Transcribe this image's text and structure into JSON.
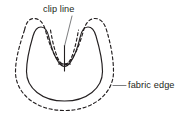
{
  "diagram": {
    "background_color": "#ffffff",
    "line_color": "#231f20",
    "text_color": "#231f20",
    "labels": [
      {
        "id": "clip-line",
        "text": "clip line",
        "x": 43,
        "y": 12,
        "leader": "line from text down-left to dashed clip-line mark inside notch"
      },
      {
        "id": "fabric-edge",
        "text": "fabric edge",
        "x": 128,
        "y": 88,
        "leader": "short horizontal line from text left to dashed fabric outline"
      }
    ],
    "shapes": [
      {
        "id": "fabric-edge-outline",
        "style": "dashed",
        "description": "outer dashed U / tulip silhouette representing the raw fabric edge"
      },
      {
        "id": "seam-outline",
        "style": "solid",
        "description": "inner solid U / tulip silhouette representing the stitched seam line"
      },
      {
        "id": "clip-line-marks",
        "style": "dashed",
        "description": "dashed V-shaped clip guide inside the central notch"
      },
      {
        "id": "center-cross",
        "style": "solid",
        "description": "small plus / cross mark at the base of the clip line"
      }
    ]
  }
}
